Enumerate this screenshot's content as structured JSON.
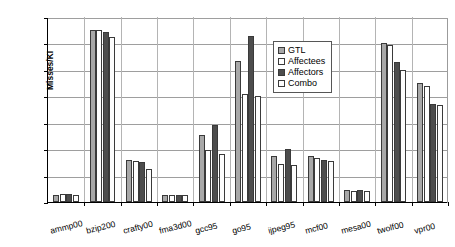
{
  "chart_data": {
    "type": "bar",
    "title": "",
    "xlabel": "",
    "ylabel": "Misses/KI",
    "ylim": [
      0,
      7
    ],
    "yticks": [
      0,
      1,
      2,
      3,
      4,
      5,
      6,
      7
    ],
    "grid": true,
    "legend_position": "upper-right-inside",
    "categories": [
      "ammp00",
      "bzip200",
      "crafty00",
      "fma3d00",
      "gcc95",
      "go95",
      "ijpeg95",
      "mcf00",
      "mesa00",
      "twolf00",
      "vpr00"
    ],
    "series": [
      {
        "name": "GTL",
        "color": "#a8a8a8",
        "values": [
          0.28,
          6.5,
          1.6,
          0.25,
          2.55,
          5.35,
          1.75,
          1.75,
          0.45,
          6.0,
          4.5
        ]
      },
      {
        "name": "Affectees",
        "color": "#ffffff",
        "values": [
          0.3,
          6.52,
          1.55,
          0.25,
          1.95,
          4.1,
          1.45,
          1.65,
          0.42,
          5.95,
          4.4
        ]
      },
      {
        "name": "Affectors",
        "color": "#4d4d4d",
        "values": [
          0.3,
          6.42,
          1.5,
          0.28,
          2.9,
          6.3,
          2.0,
          1.6,
          0.45,
          5.3,
          3.7
        ]
      },
      {
        "name": "Combo",
        "color": "#fdfdfd",
        "values": [
          0.25,
          6.25,
          1.25,
          0.25,
          1.8,
          4.0,
          1.4,
          1.55,
          0.4,
          5.0,
          3.68
        ]
      }
    ]
  },
  "legend": {
    "items": [
      {
        "label": "GTL"
      },
      {
        "label": "Affectees"
      },
      {
        "label": "Affectors"
      },
      {
        "label": "Combo"
      }
    ]
  }
}
